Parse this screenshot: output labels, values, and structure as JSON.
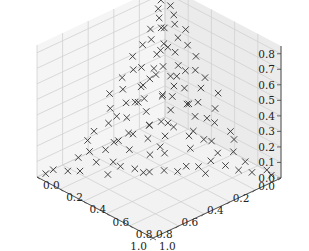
{
  "chart_data": {
    "type": "scatter",
    "projection": "3d",
    "title": "",
    "xlabel": "",
    "ylabel": "",
    "zlabel": "",
    "marker": "x",
    "marker_color": "#333333",
    "xlim": [
      0.0,
      1.0
    ],
    "ylim": [
      0.0,
      1.0
    ],
    "zlim": [
      0.0,
      0.85
    ],
    "x_ticks": [
      "0.0",
      "0.2",
      "0.4",
      "0.6",
      "0.8",
      "1.0"
    ],
    "y_ticks": [
      "0.0",
      "0.2",
      "0.4",
      "0.6",
      "0.8",
      "1.0"
    ],
    "z_ticks": [
      "0.0",
      "0.1",
      "0.2",
      "0.3",
      "0.4",
      "0.5",
      "0.6",
      "0.7",
      "0.8"
    ],
    "grid": true,
    "legend": null,
    "points": [
      [
        0.02,
        0.05,
        0.82
      ],
      [
        0.05,
        0.02,
        0.78
      ],
      [
        0.03,
        0.08,
        0.76
      ],
      [
        0.08,
        0.03,
        0.74
      ],
      [
        0.04,
        0.12,
        0.72
      ],
      [
        0.1,
        0.06,
        0.7
      ],
      [
        0.06,
        0.15,
        0.68
      ],
      [
        0.12,
        0.1,
        0.66
      ],
      [
        0.02,
        0.2,
        0.65
      ],
      [
        0.15,
        0.04,
        0.64
      ],
      [
        0.08,
        0.2,
        0.62
      ],
      [
        0.18,
        0.08,
        0.6
      ],
      [
        0.05,
        0.25,
        0.58
      ],
      [
        0.22,
        0.05,
        0.57
      ],
      [
        0.12,
        0.22,
        0.55
      ],
      [
        0.2,
        0.15,
        0.54
      ],
      [
        0.03,
        0.3,
        0.52
      ],
      [
        0.28,
        0.03,
        0.51
      ],
      [
        0.15,
        0.28,
        0.5
      ],
      [
        0.25,
        0.18,
        0.48
      ],
      [
        0.08,
        0.35,
        0.47
      ],
      [
        0.32,
        0.08,
        0.46
      ],
      [
        0.18,
        0.3,
        0.45
      ],
      [
        0.3,
        0.2,
        0.44
      ],
      [
        0.05,
        0.4,
        0.43
      ],
      [
        0.38,
        0.05,
        0.42
      ],
      [
        0.22,
        0.32,
        0.41
      ],
      [
        0.35,
        0.18,
        0.4
      ],
      [
        0.1,
        0.42,
        0.39
      ],
      [
        0.42,
        0.1,
        0.38
      ],
      [
        0.26,
        0.35,
        0.37
      ],
      [
        0.38,
        0.24,
        0.36
      ],
      [
        0.02,
        0.48,
        0.35
      ],
      [
        0.46,
        0.03,
        0.34
      ],
      [
        0.15,
        0.45,
        0.33
      ],
      [
        0.44,
        0.15,
        0.32
      ],
      [
        0.3,
        0.38,
        0.31
      ],
      [
        0.4,
        0.28,
        0.3
      ],
      [
        0.08,
        0.52,
        0.29
      ],
      [
        0.5,
        0.08,
        0.28
      ],
      [
        0.2,
        0.48,
        0.27
      ],
      [
        0.48,
        0.2,
        0.26
      ],
      [
        0.34,
        0.4,
        0.25
      ],
      [
        0.42,
        0.33,
        0.24
      ],
      [
        0.12,
        0.56,
        0.23
      ],
      [
        0.55,
        0.12,
        0.22
      ],
      [
        0.25,
        0.52,
        0.21
      ],
      [
        0.52,
        0.26,
        0.2
      ],
      [
        0.38,
        0.42,
        0.19
      ],
      [
        0.46,
        0.36,
        0.18
      ],
      [
        0.05,
        0.62,
        0.17
      ],
      [
        0.6,
        0.05,
        0.16
      ],
      [
        0.18,
        0.6,
        0.15
      ],
      [
        0.58,
        0.2,
        0.14
      ],
      [
        0.3,
        0.55,
        0.13
      ],
      [
        0.55,
        0.3,
        0.12
      ],
      [
        0.42,
        0.46,
        0.11
      ],
      [
        0.48,
        0.4,
        0.1
      ],
      [
        0.1,
        0.7,
        0.09
      ],
      [
        0.68,
        0.1,
        0.08
      ],
      [
        0.24,
        0.66,
        0.07
      ],
      [
        0.64,
        0.26,
        0.06
      ],
      [
        0.36,
        0.58,
        0.05
      ],
      [
        0.58,
        0.38,
        0.04
      ],
      [
        0.46,
        0.5,
        0.03
      ],
      [
        0.52,
        0.44,
        0.02
      ],
      [
        0.02,
        0.9,
        0.02
      ],
      [
        0.9,
        0.03,
        0.02
      ],
      [
        0.15,
        0.8,
        0.03
      ],
      [
        0.8,
        0.15,
        0.02
      ],
      [
        0.3,
        0.68,
        0.02
      ],
      [
        0.7,
        0.28,
        0.01
      ],
      [
        0.95,
        0.02,
        0.01
      ],
      [
        0.03,
        0.95,
        0.01
      ],
      [
        0.12,
        0.3,
        0.35
      ],
      [
        0.28,
        0.12,
        0.36
      ],
      [
        0.2,
        0.2,
        0.3
      ],
      [
        0.1,
        0.1,
        0.55
      ],
      [
        0.16,
        0.16,
        0.45
      ],
      [
        0.24,
        0.24,
        0.32
      ],
      [
        0.32,
        0.32,
        0.22
      ],
      [
        0.4,
        0.4,
        0.12
      ],
      [
        0.06,
        0.06,
        0.62
      ],
      [
        0.14,
        0.36,
        0.28
      ],
      [
        0.36,
        0.14,
        0.29
      ],
      [
        0.04,
        0.22,
        0.4
      ],
      [
        0.22,
        0.04,
        0.42
      ],
      [
        0.3,
        0.1,
        0.25
      ],
      [
        0.1,
        0.3,
        0.24
      ],
      [
        0.45,
        0.22,
        0.15
      ],
      [
        0.22,
        0.45,
        0.14
      ],
      [
        0.5,
        0.15,
        0.1
      ],
      [
        0.15,
        0.5,
        0.11
      ],
      [
        0.6,
        0.15,
        0.08
      ],
      [
        0.15,
        0.62,
        0.07
      ],
      [
        0.7,
        0.18,
        0.05
      ],
      [
        0.18,
        0.72,
        0.04
      ],
      [
        0.08,
        0.45,
        0.2
      ],
      [
        0.45,
        0.08,
        0.21
      ],
      [
        0.35,
        0.25,
        0.18
      ],
      [
        0.25,
        0.35,
        0.17
      ],
      [
        0.05,
        0.08,
        0.5
      ],
      [
        0.08,
        0.05,
        0.48
      ],
      [
        0.12,
        0.18,
        0.38
      ],
      [
        0.18,
        0.12,
        0.39
      ],
      [
        0.65,
        0.05,
        0.12
      ],
      [
        0.05,
        0.65,
        0.13
      ],
      [
        0.75,
        0.08,
        0.06
      ],
      [
        0.08,
        0.78,
        0.05
      ],
      [
        0.85,
        0.1,
        0.02
      ],
      [
        0.1,
        0.86,
        0.02
      ],
      [
        0.4,
        0.55,
        0.02
      ],
      [
        0.55,
        0.42,
        0.02
      ],
      [
        0.62,
        0.3,
        0.04
      ],
      [
        0.3,
        0.62,
        0.04
      ]
    ]
  }
}
